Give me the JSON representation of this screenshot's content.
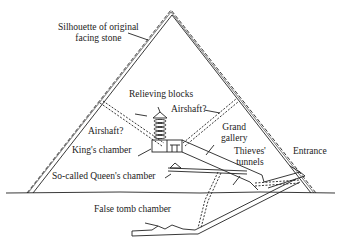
{
  "diagram": {
    "labels": {
      "facing_stone_line1": "Silhouette of original",
      "facing_stone_line2": "facing stone",
      "relieving_blocks": "Relieving blocks",
      "airshaft_right": "Airshaft?",
      "airshaft_left": "Airshaft?",
      "grand_gallery_line1": "Grand",
      "grand_gallery_line2": "gallery",
      "kings_chamber": "King's chamber",
      "thieves_tunnels_line1": "Thieves'",
      "thieves_tunnels_line2": "tunnels",
      "entrance": "Entrance",
      "queens_chamber": "So-called Queen's chamber",
      "false_tomb": "False tomb chamber"
    },
    "colors": {
      "line": "#222222",
      "background": "#ffffff"
    }
  }
}
